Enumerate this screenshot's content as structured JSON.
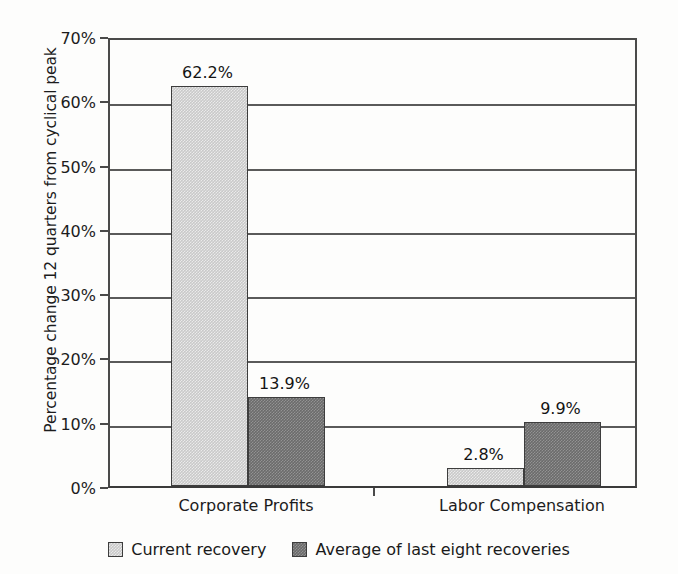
{
  "chart_data": {
    "type": "bar",
    "title": "",
    "subtitle": "",
    "xlabel": "",
    "ylabel": "Percentage change 12 quarters from cyclical peak",
    "categories": [
      "Corporate Profits",
      "Labor Compensation"
    ],
    "series": [
      {
        "name": "Current recovery",
        "color": "#c9c9c9",
        "values": [
          62.2,
          2.8
        ],
        "value_labels": [
          "62.2%",
          "2.8%"
        ]
      },
      {
        "name": "Average of last eight recoveries",
        "color": "#6b6b6b",
        "values": [
          13.9,
          9.9
        ],
        "value_labels": [
          "13.9%",
          "9.9%"
        ]
      }
    ],
    "ylim": [
      0,
      70
    ],
    "ytick_values": [
      0,
      10,
      20,
      30,
      40,
      50,
      60,
      70
    ],
    "ytick_labels": [
      "0%",
      "10%",
      "20%",
      "30%",
      "40%",
      "50%",
      "60%",
      "70%"
    ],
    "grid": true,
    "grid_axis": "y",
    "legend_position": "bottom",
    "units": "percent"
  },
  "axes": {
    "y_title": "Percentage change 12 quarters from cyclical peak",
    "ticks": [
      {
        "label": "70%",
        "value": 70
      },
      {
        "label": "60%",
        "value": 60
      },
      {
        "label": "50%",
        "value": 50
      },
      {
        "label": "40%",
        "value": 40
      },
      {
        "label": "30%",
        "value": 30
      },
      {
        "label": "20%",
        "value": 20
      },
      {
        "label": "10%",
        "value": 10
      },
      {
        "label": "0%",
        "value": 0
      }
    ],
    "categories": [
      {
        "label": "Corporate Profits"
      },
      {
        "label": "Labor Compensation"
      }
    ]
  },
  "bars": [
    {
      "group": "Corporate Profits",
      "series": "Current recovery",
      "value": 62.2,
      "label": "62.2%",
      "tone": "light"
    },
    {
      "group": "Corporate Profits",
      "series": "Average of last eight recoveries",
      "value": 13.9,
      "label": "13.9%",
      "tone": "dark"
    },
    {
      "group": "Labor Compensation",
      "series": "Current recovery",
      "value": 2.8,
      "label": "2.8%",
      "tone": "light"
    },
    {
      "group": "Labor Compensation",
      "series": "Average of last eight recoveries",
      "value": 9.9,
      "label": "9.9%",
      "tone": "dark"
    }
  ],
  "legend": {
    "items": [
      {
        "label": "Current recovery",
        "tone": "light",
        "color": "#c9c9c9"
      },
      {
        "label": "Average of last eight recoveries",
        "tone": "dark",
        "color": "#6b6b6b"
      }
    ]
  }
}
